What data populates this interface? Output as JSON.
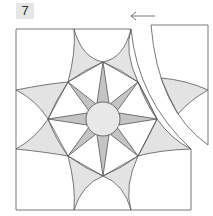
{
  "step": {
    "number": "7"
  },
  "diagram": {
    "arrow_direction": "left",
    "colors": {
      "light_fill": "#e3e3e3",
      "dark_fill": "#c4c4c4",
      "circle_fill": "#e8e8e8",
      "stroke": "#555555",
      "background": "#ffffff"
    }
  }
}
